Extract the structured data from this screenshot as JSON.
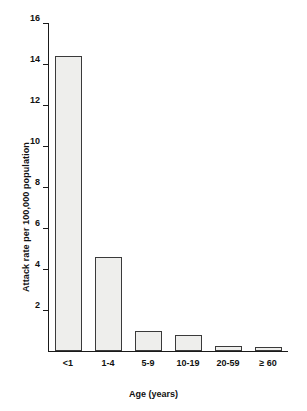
{
  "chart_data": {
    "type": "bar",
    "title": "",
    "subtitle": "",
    "xlabel": "Age (years)",
    "ylabel": "Attack rate per 100,000 population",
    "categories": [
      "<1",
      "1-4",
      "5-9",
      "10-19",
      "20-59",
      "≥ 60"
    ],
    "values": [
      14.4,
      4.6,
      1.0,
      0.8,
      0.25,
      0.2
    ],
    "series": [
      {
        "name": "Attack rate",
        "values": [
          14.4,
          4.6,
          1.0,
          0.8,
          0.25,
          0.2
        ]
      }
    ],
    "ylim": [
      0,
      16
    ],
    "yticks": [
      2,
      4,
      6,
      8,
      10,
      12,
      14,
      16
    ],
    "ytick_labels": [
      "2",
      "4",
      "6",
      "8",
      "10",
      "12",
      "14",
      "16"
    ],
    "grid": false,
    "legend": null,
    "legend_position": "none",
    "annotations": [],
    "colors": {
      "bar_fill": "#eeeeec",
      "bar_edge": "#3a3a3a",
      "axis": "#1a1a1a",
      "text": "#111111",
      "background": "#ffffff"
    }
  }
}
